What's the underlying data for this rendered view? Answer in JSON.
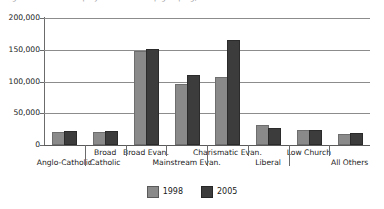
{
  "caption_sliver": "Figure 3. Membership by churchmanship grouping, 1998 and 2005",
  "chart_data": {
    "type": "bar",
    "title": "",
    "xlabel": "",
    "ylabel": "",
    "ylim": [
      0,
      200000
    ],
    "yticks": [
      0,
      50000,
      100000,
      150000,
      200000
    ],
    "ytick_labels": [
      "0",
      "50,000",
      "100,000",
      "150,000",
      "200,000"
    ],
    "grid": true,
    "legend_position": "bottom-center",
    "categories": [
      "Anglo-Catholic",
      "Broad Catholic",
      "Broad Evan.",
      "Mainstream Evan.",
      "Charismatic Evan.",
      "Liberal",
      "Low Church",
      "All Others"
    ],
    "category_label_lines": [
      [
        "",
        "Anglo-Catholic"
      ],
      [
        "Broad",
        "Catholic"
      ],
      [
        "Broad Evan.",
        ""
      ],
      [
        "",
        "Mainstream Evan."
      ],
      [
        "Charismatic Evan.",
        ""
      ],
      [
        "",
        "Liberal"
      ],
      [
        "Low Church",
        ""
      ],
      [
        "",
        "All Others"
      ]
    ],
    "series": [
      {
        "name": "1998",
        "color": "#8a8a8a",
        "values": [
          17000,
          17000,
          145000,
          93000,
          104000,
          28000,
          20000,
          14000
        ]
      },
      {
        "name": "2005",
        "color": "#3c3c3c",
        "values": [
          19000,
          19000,
          148000,
          107000,
          162000,
          23000,
          20000,
          16000
        ]
      }
    ]
  },
  "legend": {
    "items": [
      {
        "label": "1998",
        "color": "#8a8a8a"
      },
      {
        "label": "2005",
        "color": "#3c3c3c"
      }
    ]
  }
}
